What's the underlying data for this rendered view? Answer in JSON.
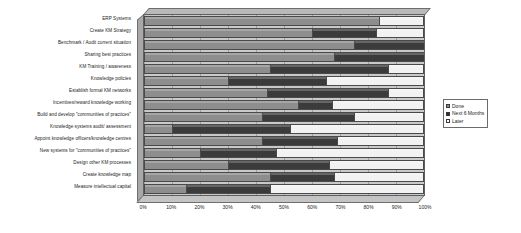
{
  "chart_data": {
    "type": "bar",
    "orientation": "horizontal",
    "stacked": true,
    "title": "",
    "xlabel": "",
    "ylabel": "",
    "xlim": [
      0,
      100
    ],
    "xticks": [
      "0%",
      "10%",
      "20%",
      "30%",
      "40%",
      "50%",
      "60%",
      "70%",
      "80%",
      "90%",
      "100%"
    ],
    "grid": true,
    "legend_position": "right",
    "categories": [
      "ERP Systems",
      "Create KM Strategy",
      "Benchmark / Audit current situation",
      "Sharing best practices",
      "KM Training / awareness",
      "Knowledge policies",
      "Establish formal KM networks",
      "Incentives/reward knowledge working",
      "Build and develop \"communities of practices\"",
      "Knowledge systems audit/ assessment",
      "Appoint knowledge officers/knowledge centres",
      "New systems for \"communities of practices\"",
      "Design other KM processes",
      "Create knowledge map",
      "Measure intellectual capital"
    ],
    "series": [
      {
        "name": "Done",
        "color": "#8e8e8e",
        "values": [
          84,
          60,
          75,
          68,
          45,
          30,
          44,
          55,
          42,
          10,
          42,
          20,
          30,
          45,
          15
        ]
      },
      {
        "name": "Next 6 Months",
        "color": "#3b3b3b",
        "values": [
          0,
          23,
          25,
          32,
          42,
          35,
          43,
          12,
          33,
          42,
          27,
          27,
          36,
          23,
          30
        ]
      },
      {
        "name": "Later",
        "color": "#f2f2f2",
        "values": [
          16,
          17,
          0,
          0,
          13,
          35,
          13,
          33,
          25,
          48,
          31,
          53,
          34,
          32,
          55
        ]
      }
    ]
  }
}
